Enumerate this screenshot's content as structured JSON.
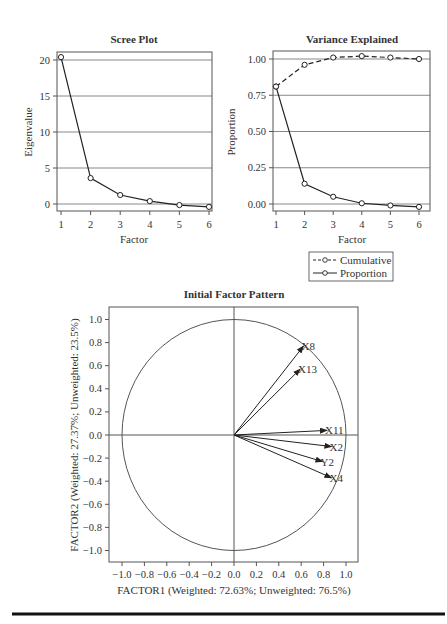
{
  "chart_data": [
    {
      "type": "line",
      "title": "Scree Plot",
      "xlabel": "Factor",
      "ylabel": "Eigenvalue",
      "x": [
        1,
        2,
        3,
        4,
        5,
        6
      ],
      "xticks": [
        "1",
        "2",
        "3",
        "4",
        "5",
        "6"
      ],
      "yticks": [
        "0",
        "5",
        "10",
        "15",
        "20"
      ],
      "ylim": [
        -1,
        21
      ],
      "grid": true,
      "series": [
        {
          "name": "Eigenvalue",
          "values": [
            20.4,
            3.6,
            1.25,
            0.4,
            -0.15,
            -0.4
          ],
          "style": "solid",
          "marker": "open-circle"
        }
      ]
    },
    {
      "type": "line",
      "title": "Variance Explained",
      "xlabel": "Factor",
      "ylabel": "Proportion",
      "x": [
        1,
        2,
        3,
        4,
        5,
        6
      ],
      "xticks": [
        "1",
        "2",
        "3",
        "4",
        "5",
        "6"
      ],
      "yticks": [
        "0.00",
        "0.25",
        "0.50",
        "0.75",
        "1.00"
      ],
      "ylim": [
        -0.05,
        1.05
      ],
      "grid": true,
      "legend": {
        "position": "below-right",
        "entries": [
          "Cumulative",
          "Proportion"
        ]
      },
      "series": [
        {
          "name": "Cumulative",
          "values": [
            0.81,
            0.96,
            1.01,
            1.02,
            1.01,
            1.0
          ],
          "style": "dashed",
          "marker": "open-circle"
        },
        {
          "name": "Proportion",
          "values": [
            0.81,
            0.14,
            0.05,
            0.005,
            -0.01,
            -0.02
          ],
          "style": "solid",
          "marker": "open-circle"
        }
      ]
    },
    {
      "type": "scatter",
      "subtype": "factor-pattern-vectors",
      "title": "Initial Factor Pattern",
      "xlabel": "FACTOR1 (Weighted: 72.63%; Unweighted: 76.5%)",
      "ylabel": "FACTOR2 (Weighted: 27.37%; Unweighted: 23.5%)",
      "xlim": [
        -1.1,
        1.1
      ],
      "ylim": [
        -1.1,
        1.1
      ],
      "xticks": [
        "−1.0",
        "−0.8",
        "−0.6",
        "−0.4",
        "−0.2",
        "0.0",
        "0.2",
        "0.4",
        "0.6",
        "0.8",
        "1.0"
      ],
      "yticks": [
        "1.0",
        "0.8",
        "0.6",
        "0.4",
        "0.2",
        "0.0",
        "−0.2",
        "−0.4",
        "−0.6",
        "−0.8",
        "−1.0"
      ],
      "unit_circle": true,
      "points": [
        {
          "label": "X8",
          "x": 0.62,
          "y": 0.77
        },
        {
          "label": "X13",
          "x": 0.59,
          "y": 0.57
        },
        {
          "label": "X11",
          "x": 0.83,
          "y": 0.04
        },
        {
          "label": "X2",
          "x": 0.87,
          "y": -0.1
        },
        {
          "label": "Y2",
          "x": 0.79,
          "y": -0.23
        },
        {
          "label": "X4",
          "x": 0.87,
          "y": -0.37
        }
      ]
    }
  ]
}
